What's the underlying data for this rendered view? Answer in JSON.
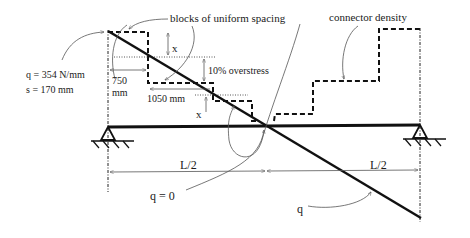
{
  "labels": {
    "blocks": "blocks of uniform spacing",
    "connector_density": "connector density",
    "q_value": "q = 354 N/mm",
    "s_value": "s = 170 mm",
    "dim_750_a": "750",
    "dim_750_b": "mm",
    "dim_1050": "1050 mm",
    "overstress": "10% overstress",
    "x_top": "x",
    "x_bottom": "x",
    "half_left": "L/2",
    "half_right": "L/2",
    "q_zero": "q = 0",
    "q": "q"
  },
  "colors": {
    "line": "#111111",
    "annotation": "#555555",
    "background": "#ffffff"
  }
}
